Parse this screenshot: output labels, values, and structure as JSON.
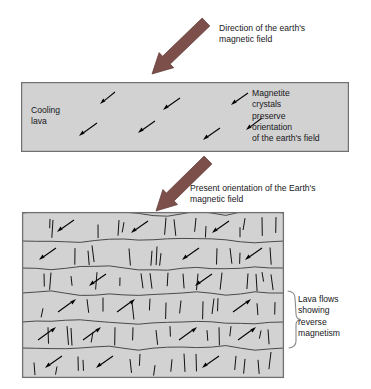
{
  "figure": {
    "background_color": "#ffffff",
    "width": 371,
    "height": 389
  },
  "colors": {
    "rock_fill": "#d2d2d2",
    "rock_stroke": "#707070",
    "big_arrow_fill": "#7d4f4a",
    "big_arrow_stroke": "#5f3a36",
    "crystal_arrow": "#000000",
    "text": "#17171a",
    "brace": "#8a8a8a"
  },
  "captions": {
    "direction_field": "Direction of the earth's\nmagnetic field",
    "present_orientation": "Present orientation of the Earth's\nmagnetic field",
    "cooling_lava": "Cooling\nlava",
    "magnetite_crystals": "Magnetite\ncrystals\npreserve\norientation\nof the earth's field",
    "lava_flows_reverse": "Lava flows\nshowing\nreverse\nmagnetism"
  },
  "big_arrows": [
    {
      "name": "earth-field-direction-arrow",
      "from_x": 206,
      "from_y": 22,
      "to_x": 152,
      "to_y": 74,
      "width": 11,
      "head_width": 21,
      "head_length": 20
    },
    {
      "name": "present-field-direction-arrow",
      "from_x": 208,
      "from_y": 160,
      "to_x": 156,
      "to_y": 211,
      "width": 11,
      "head_width": 21,
      "head_length": 20
    }
  ],
  "cooling_lava_box": {
    "x": 21,
    "y": 82,
    "width": 328,
    "height": 70,
    "crystal_arrows": [
      {
        "x1": 115,
        "y1": 92,
        "x2": 100,
        "y2": 104
      },
      {
        "x1": 180,
        "y1": 98,
        "x2": 163,
        "y2": 110
      },
      {
        "x1": 248,
        "y1": 93,
        "x2": 231,
        "y2": 105
      },
      {
        "x1": 97,
        "y1": 123,
        "x2": 79,
        "y2": 136
      },
      {
        "x1": 155,
        "y1": 121,
        "x2": 138,
        "y2": 133
      },
      {
        "x1": 220,
        "y1": 128,
        "x2": 203,
        "y2": 140
      },
      {
        "x1": 262,
        "y1": 118,
        "x2": 246,
        "y2": 130
      }
    ]
  },
  "lava_flow_block": {
    "x": 22,
    "y": 212,
    "width": 262,
    "height": 166,
    "layers": [
      {
        "index": 1,
        "name": "layer-normal-1",
        "polarity": "normal",
        "top": 213,
        "bottom": 241,
        "arrows": [
          {
            "x1": 74,
            "y1": 220,
            "x2": 57,
            "y2": 232
          },
          {
            "x1": 148,
            "y1": 221,
            "x2": 131,
            "y2": 233
          },
          {
            "x1": 229,
            "y1": 221,
            "x2": 212,
            "y2": 233
          }
        ],
        "cracks": [
          50,
          53,
          98,
          119,
          124,
          166,
          174,
          196,
          206,
          240,
          245,
          262,
          276
        ]
      },
      {
        "index": 2,
        "name": "layer-normal-2",
        "polarity": "normal",
        "top": 241,
        "bottom": 268,
        "arrows": [
          {
            "x1": 56,
            "y1": 248,
            "x2": 39,
            "y2": 260
          },
          {
            "x1": 199,
            "y1": 248,
            "x2": 182,
            "y2": 260
          },
          {
            "x1": 262,
            "y1": 248,
            "x2": 245,
            "y2": 260
          }
        ],
        "cracks": [
          75,
          88,
          92,
          129,
          152,
          157,
          161,
          217,
          230,
          240,
          270
        ]
      },
      {
        "index": 3,
        "name": "layer-normal-3",
        "polarity": "normal",
        "top": 268,
        "bottom": 293,
        "arrows": [
          {
            "x1": 106,
            "y1": 274,
            "x2": 89,
            "y2": 286
          },
          {
            "x1": 212,
            "y1": 274,
            "x2": 195,
            "y2": 286
          }
        ],
        "cracks": [
          44,
          51,
          71,
          97,
          120,
          141,
          150,
          168,
          183,
          198,
          222,
          248,
          256,
          262,
          271
        ]
      },
      {
        "index": 4,
        "name": "layer-reverse-1",
        "polarity": "reverse",
        "top": 293,
        "bottom": 322,
        "arrows": [
          {
            "x1": 58,
            "y1": 312,
            "x2": 76,
            "y2": 299
          },
          {
            "x1": 117,
            "y1": 312,
            "x2": 135,
            "y2": 299
          },
          {
            "x1": 233,
            "y1": 312,
            "x2": 251,
            "y2": 299
          }
        ],
        "cracks": [
          43,
          87,
          103,
          132,
          150,
          166,
          181,
          203,
          214,
          218,
          257,
          275
        ]
      },
      {
        "index": 5,
        "name": "layer-reverse-2",
        "polarity": "reverse",
        "top": 322,
        "bottom": 348,
        "arrows": [
          {
            "x1": 38,
            "y1": 340,
            "x2": 56,
            "y2": 327
          },
          {
            "x1": 83,
            "y1": 340,
            "x2": 101,
            "y2": 327
          },
          {
            "x1": 179,
            "y1": 340,
            "x2": 197,
            "y2": 327
          },
          {
            "x1": 238,
            "y1": 340,
            "x2": 256,
            "y2": 327
          }
        ],
        "cracks": [
          48,
          67,
          71,
          93,
          115,
          133,
          156,
          170,
          207,
          219,
          231,
          261,
          268
        ]
      },
      {
        "index": 6,
        "name": "layer-normal-4",
        "polarity": "normal",
        "top": 348,
        "bottom": 378,
        "arrows": [
          {
            "x1": 62,
            "y1": 356,
            "x2": 45,
            "y2": 368
          },
          {
            "x1": 113,
            "y1": 356,
            "x2": 96,
            "y2": 368
          },
          {
            "x1": 219,
            "y1": 356,
            "x2": 202,
            "y2": 368
          }
        ],
        "cracks": [
          34,
          57,
          78,
          83,
          130,
          140,
          155,
          172,
          184,
          196,
          236,
          245,
          258,
          271
        ]
      }
    ],
    "brace": {
      "name": "reverse-magnetism-brace",
      "x": 289,
      "top": 291,
      "bottom": 348
    }
  }
}
